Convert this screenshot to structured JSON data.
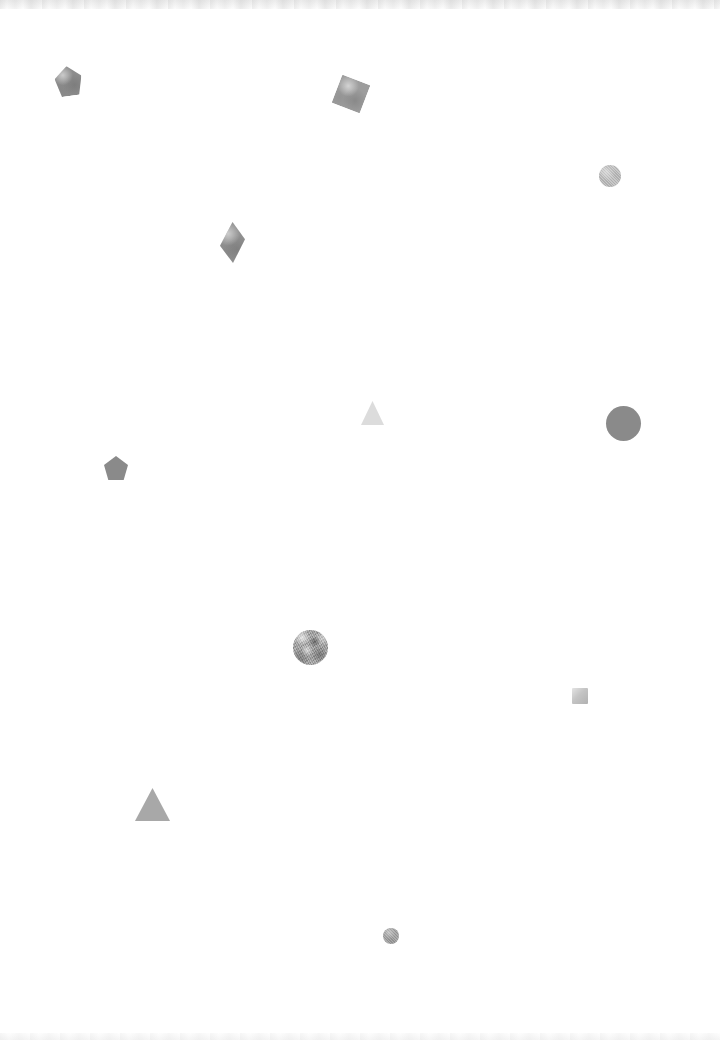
{
  "canvas": {
    "width": 720,
    "height": 1040,
    "background_color": "#ffffff",
    "title": "Scattered Shapes Canvas"
  },
  "edges": {
    "top_band_label": "top-scan-band",
    "bottom_band_label": "bottom-scan-band"
  },
  "shapes": [
    {
      "name": "pentagon-top-left",
      "kind": "pentagon",
      "label": "Pentagon",
      "x": 55,
      "y": 66,
      "width": 27,
      "height": 30,
      "rotation": -8,
      "color": "#8c8c8c",
      "texture": "tex-soft",
      "opacity": 1
    },
    {
      "name": "square-top-center",
      "kind": "square",
      "label": "Rotated square",
      "x": 336,
      "y": 79,
      "width": 30,
      "height": 30,
      "rotation": 21,
      "color": "#9d9d9d",
      "texture": "tex-soft",
      "opacity": 1
    },
    {
      "name": "circle-textured-upper-right",
      "kind": "circle",
      "label": "Textured circle",
      "x": 599,
      "y": 165,
      "width": 22,
      "height": 22,
      "rotation": 0,
      "color": "#bcbcbc",
      "texture": "tex-grain",
      "opacity": 1
    },
    {
      "name": "diamond-upper-left",
      "kind": "diamond",
      "label": "Diamond",
      "x": 220,
      "y": 222,
      "width": 25,
      "height": 41,
      "rotation": 0,
      "color": "#909090",
      "texture": "tex-soft",
      "opacity": 1
    },
    {
      "name": "triangle-pale-center",
      "kind": "triangle",
      "label": "Pale triangle",
      "x": 361,
      "y": 401,
      "width": 23,
      "height": 24,
      "rotation": 0,
      "color": "#dcdcdc",
      "texture": "none",
      "opacity": 1
    },
    {
      "name": "circle-large-right",
      "kind": "circle",
      "label": "Large circle",
      "x": 606,
      "y": 406,
      "width": 35,
      "height": 35,
      "rotation": 0,
      "color": "#8a8a8a",
      "texture": "none",
      "opacity": 1
    },
    {
      "name": "pentagon-mid-left",
      "kind": "pentagon",
      "label": "Pentagon",
      "x": 104,
      "y": 456,
      "width": 24,
      "height": 24,
      "rotation": 0,
      "color": "#8a8a8a",
      "texture": "none",
      "opacity": 1
    },
    {
      "name": "circle-photo-center",
      "kind": "circle",
      "label": "Photo-textured circle",
      "x": 293,
      "y": 630,
      "width": 35,
      "height": 35,
      "rotation": 0,
      "color": "#a6a6a6",
      "texture": "tex-photo",
      "opacity": 1
    },
    {
      "name": "square-small-right",
      "kind": "square",
      "label": "Small square",
      "x": 572,
      "y": 688,
      "width": 16,
      "height": 16,
      "rotation": 0,
      "color": "#c4c4c4",
      "texture": "tex-grad-sq",
      "opacity": 1
    },
    {
      "name": "triangle-lower-left",
      "kind": "triangle",
      "label": "Triangle",
      "x": 135,
      "y": 788,
      "width": 35,
      "height": 33,
      "rotation": 0,
      "color": "#a8a8a8",
      "texture": "none",
      "opacity": 1
    },
    {
      "name": "circle-small-bottom",
      "kind": "circle",
      "label": "Small circle",
      "x": 383,
      "y": 928,
      "width": 16,
      "height": 16,
      "rotation": 0,
      "color": "#9a9a9a",
      "texture": "tex-grain",
      "opacity": 1
    }
  ]
}
